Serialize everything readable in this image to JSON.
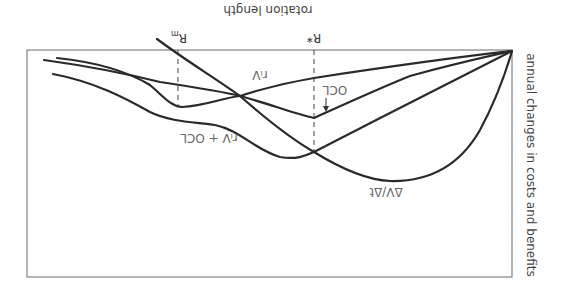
{
  "diagram": {
    "orientation": "rotated 180 degrees",
    "axes": {
      "x_label": "rotation length",
      "y_label": "annual changes in costs and benefits"
    },
    "markers": [
      {
        "id": "r-m",
        "label": "R",
        "subscript": "m"
      },
      {
        "id": "r-star",
        "label": "R*"
      }
    ],
    "curves": [
      {
        "id": "riv",
        "label": "rᵢV"
      },
      {
        "id": "ocl",
        "label": "OCL"
      },
      {
        "id": "riv-ocl",
        "label": "rᵢV + OCL"
      },
      {
        "id": "dv-dt",
        "label": "ΔV/Δt"
      }
    ],
    "arrow": {
      "label_target": "OCL",
      "icon": "arrow-down-icon"
    }
  }
}
